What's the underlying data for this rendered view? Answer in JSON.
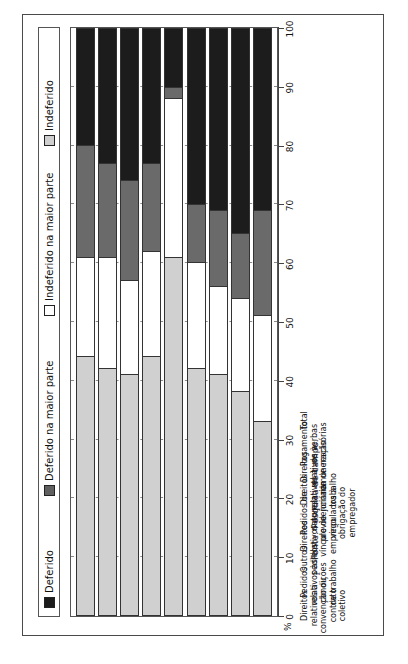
{
  "title": "(Rio de Janeiro, 1995-2000)",
  "footer": "Fonte: Pesquisa de campo.",
  "axis": {
    "unit_label": "%",
    "ticks": [
      "0",
      "10",
      "20",
      "30",
      "40",
      "50",
      "60",
      "70",
      "80",
      "90",
      "100"
    ]
  },
  "legend": {
    "items": [
      {
        "label": "Deferido",
        "swatch": "black",
        "color": "#1c1c1c"
      },
      {
        "label": "Deferido na maior parte",
        "swatch": "dark-gray",
        "color": "#606060"
      },
      {
        "label": "Indeferido na maior parte",
        "swatch": "white",
        "color": "#ffffff"
      },
      {
        "label": "Indeferido",
        "swatch": "light-gray",
        "color": "#cfcfcf"
      }
    ]
  },
  "chart_data": {
    "type": "bar",
    "orientation": "vertical-stacked-100",
    "title": "(Rio de Janeiro, 1995-2000)",
    "xlabel": "",
    "ylabel": "%",
    "ylim": [
      0,
      100
    ],
    "grid": true,
    "legend_position": "top",
    "categories": [
      "Direitos relativos a convenção ou contrato coletivo",
      "Pedidos relativos às condições de trabalho",
      "Outros pedidos",
      "Direitos relativos ao vínculo de emprego",
      "Pedidos de natureza previdenciária vinculados à obrigação do empregador",
      "Direitos relativos à jornada de trabalho",
      "Direitos relativos à remuneração",
      "Pagamento de verbas rescisórias",
      "Total"
    ],
    "categories_lines": [
      [
        "Direitos",
        "relativos a",
        "convenção ou",
        "contrato",
        "coletivo"
      ],
      [
        "Pedidos",
        "relativos às",
        "condições",
        "de trabalho"
      ],
      [
        "Outros",
        "pedidos"
      ],
      [
        "Direitos",
        "relativos ao",
        "vínculo de",
        "emprego"
      ],
      [
        "Pedidos de",
        "natureza",
        "previdenciária",
        "vinculados à",
        "obrigação do",
        "empregador"
      ],
      [
        "Direitos",
        "relativos à",
        "jornada de",
        "trabalho"
      ],
      [
        "Direitos",
        "relativos à",
        "remuneração"
      ],
      [
        "Pagamento",
        "de verbas",
        "rescisórias"
      ],
      [
        "Total"
      ]
    ],
    "series": [
      {
        "name": "Deferido",
        "color": "#1c1c1c",
        "values": [
          20,
          23,
          26,
          23,
          10,
          30,
          31,
          35,
          31
        ]
      },
      {
        "name": "Deferido na maior parte",
        "color": "#6a6a6a",
        "values": [
          19,
          16,
          17,
          15,
          2,
          10,
          13,
          11,
          18
        ]
      },
      {
        "name": "Indeferido na maior parte",
        "color": "#ffffff",
        "values": [
          17,
          19,
          16,
          18,
          27,
          18,
          15,
          16,
          18
        ]
      },
      {
        "name": "Indeferido",
        "color": "#d0d0d0",
        "values": [
          44,
          42,
          41,
          44,
          61,
          42,
          41,
          38,
          33
        ]
      }
    ]
  }
}
